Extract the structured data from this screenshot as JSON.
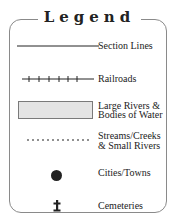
{
  "legend": {
    "title": "Legend",
    "items": [
      {
        "symbol": "solid-line",
        "label": "Section Lines"
      },
      {
        "symbol": "railroad-line",
        "label": "Railroads"
      },
      {
        "symbol": "gray-rectangle",
        "label_line1": "Large Rivers &",
        "label_line2": "Bodies of Water"
      },
      {
        "symbol": "dotted-line",
        "label_line1": "Streams/Creeks",
        "label_line2": "& Small Rivers"
      },
      {
        "symbol": "black-dot",
        "label": "Cities/Towns"
      },
      {
        "symbol": "cross",
        "label": "Cemeteries"
      }
    ]
  },
  "colors": {
    "frame": "#8a8a8a",
    "water_fill": "#e4e4e4",
    "water_border": "#7a7a7a",
    "symbol": "#222222"
  }
}
